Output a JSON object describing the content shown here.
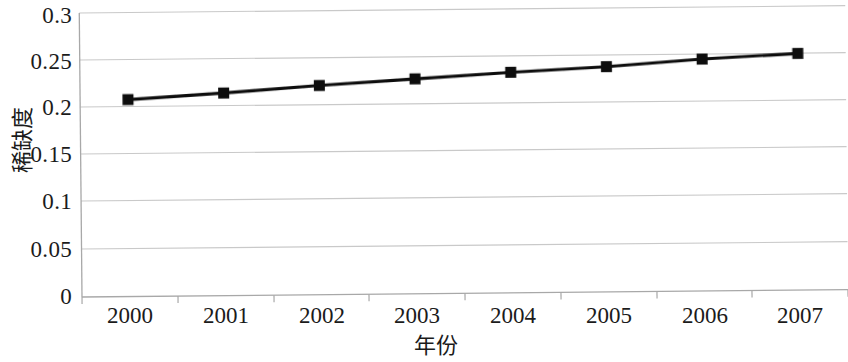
{
  "chart_data": {
    "type": "line",
    "title": "",
    "subtitle": "",
    "xlabel": "年份",
    "ylabel": "稀缺度",
    "categories": [
      "2000",
      "2001",
      "2002",
      "2003",
      "2004",
      "2005",
      "2006",
      "2007"
    ],
    "series": [
      {
        "name": "稀缺度",
        "values": [
          0.208,
          0.214,
          0.221,
          0.227,
          0.233,
          0.238,
          0.245,
          0.25
        ],
        "marker": "square",
        "marker_color": "#0d0d0d",
        "line_color": "#111111"
      }
    ],
    "ylim": [
      0,
      0.3
    ],
    "y_ticks": [
      0,
      0.05,
      0.1,
      0.15,
      0.2,
      0.25,
      0.3
    ],
    "y_tick_labels": [
      "0",
      "0.05",
      "0.1",
      "0.15",
      "0.2",
      "0.25",
      "0.3"
    ],
    "x_tick_labels": [
      "2000",
      "2001",
      "2002",
      "2003",
      "2004",
      "2005",
      "2006",
      "2007"
    ],
    "grid": true,
    "grid_color": "#c9c9c9",
    "axis_color": "#a8a8a8",
    "legend": false,
    "legend_position": "none",
    "annotations": [],
    "background": "#ffffff"
  },
  "axes": {
    "y_title": "稀缺度",
    "x_title": "年份"
  }
}
